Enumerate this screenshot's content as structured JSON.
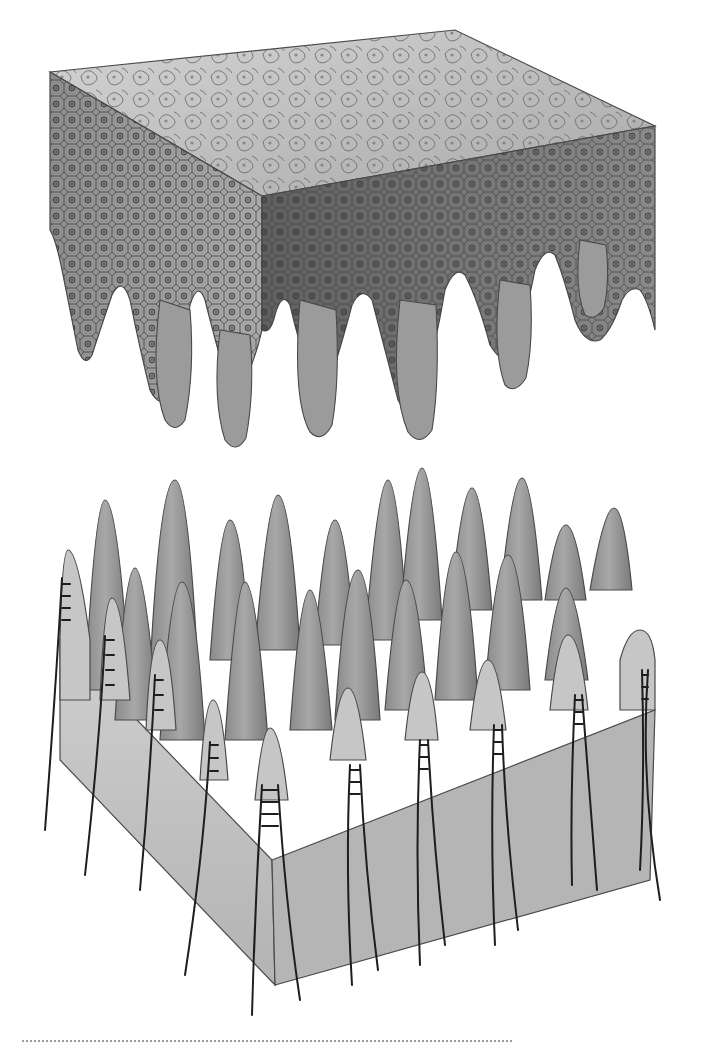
{
  "figure": {
    "panels": [
      {
        "id": "epidermis-block",
        "kind": "3d-tissue-block",
        "colors": {
          "top": "#c9c9c9",
          "left_face": "#a6a6a6",
          "right_face": "#6e6e6e",
          "outline": "#4a4a4a",
          "nucleus": "#3a3a3a"
        },
        "ridge_count": 9
      },
      {
        "id": "dermal-papillae-block",
        "kind": "3d-tissue-block",
        "colors": {
          "papilla": "#8f8f8f",
          "papilla_light": "#b8b8b8",
          "front_face": "#c4c4c4",
          "outline": "#4a4a4a",
          "nerve": "#1e1e1e"
        },
        "nerve_fiber_count": 11
      }
    ],
    "divider": {
      "style": "dotted",
      "color": "#9a9a9a"
    }
  }
}
